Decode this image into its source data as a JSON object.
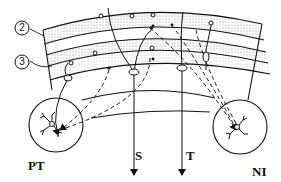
{
  "diagram": {
    "type": "neural pathway schematic (cortical/cerebellar layers with projections)",
    "layer_markers": [
      {
        "id": "layer-2",
        "label": "2"
      },
      {
        "id": "layer-3",
        "label": "3"
      }
    ],
    "targets": [
      {
        "id": "PT",
        "label": "PT"
      },
      {
        "id": "S",
        "label": "S"
      },
      {
        "id": "T",
        "label": "T"
      },
      {
        "id": "NI",
        "label": "NI"
      }
    ],
    "line_styles": {
      "solid": "excitatory/direct projection",
      "dashed": "secondary projection"
    },
    "colors": {
      "ink": "#111111",
      "stipple": "#bdbdbd",
      "background": "#ffffff"
    }
  }
}
